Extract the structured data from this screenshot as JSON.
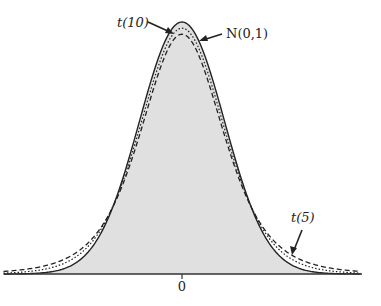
{
  "chart_data": {
    "type": "line",
    "title": "",
    "xlabel": "",
    "ylabel": "",
    "x_ticks": [
      {
        "value": 0,
        "label": "0"
      }
    ],
    "xlim": [
      -4.2,
      4.2
    ],
    "grid": false,
    "legend": null,
    "fill_under": "N(0,1)",
    "series": [
      {
        "name": "N(0,1)",
        "label_display": "N(0,1)",
        "style": "solid",
        "distribution": "normal",
        "df": null,
        "peak_density": 0.399
      },
      {
        "name": "t(10)",
        "label_display": "t(10)",
        "style": "dashed-dotted",
        "distribution": "t",
        "df": 10,
        "peak_density": 0.389
      },
      {
        "name": "t(5)",
        "label_display": "t(5)",
        "style": "dashed",
        "distribution": "t",
        "df": 5,
        "peak_density": 0.38
      }
    ],
    "annotations": [
      {
        "text": "t(10)",
        "points_to": "t(10) curve near peak"
      },
      {
        "text": "N(0,1)",
        "points_to": "N(0,1) curve near peak"
      },
      {
        "text": "t(5)",
        "points_to": "t(5) curve right tail"
      }
    ]
  },
  "labels": {
    "t10": "t(10)",
    "normal": "N(0,1)",
    "t5": "t(5)",
    "zero": "0"
  },
  "colors": {
    "fill": "#e0e0e0",
    "line": "#222222",
    "axis": "#333333"
  }
}
